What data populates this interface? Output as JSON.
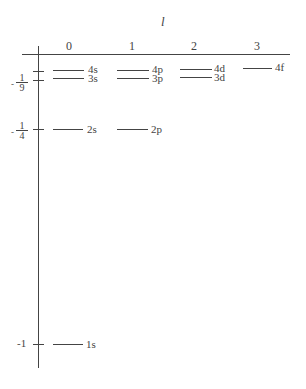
{
  "diagram": {
    "axis_title": "l",
    "columns": [
      {
        "label": "0",
        "x": 69
      },
      {
        "label": "1",
        "x": 132
      },
      {
        "label": "2",
        "x": 194
      },
      {
        "label": "3",
        "x": 257
      }
    ],
    "y_ticks": [
      {
        "label_minus": "-",
        "num": "1",
        "den": "9",
        "y": 80
      },
      {
        "label_minus": "-",
        "num": "1",
        "den": "4",
        "y": 129
      },
      {
        "label": "-1",
        "y": 344
      }
    ],
    "extra_tick_y": 71,
    "levels": [
      {
        "label": "4s",
        "x1": 53,
        "x2": 84,
        "y": 70
      },
      {
        "label": "3s",
        "x1": 53,
        "x2": 84,
        "y": 78
      },
      {
        "label": "4p",
        "x1": 117,
        "x2": 149,
        "y": 70
      },
      {
        "label": "3p",
        "x1": 117,
        "x2": 149,
        "y": 78
      },
      {
        "label": "4d",
        "x1": 180,
        "x2": 212,
        "y": 70
      },
      {
        "label": "3d",
        "x1": 180,
        "x2": 212,
        "y": 78
      },
      {
        "label": "4f",
        "x1": 243,
        "x2": 272,
        "y": 68
      },
      {
        "label": "2s",
        "x1": 53,
        "x2": 83,
        "y": 129
      },
      {
        "label": "2p",
        "x1": 117,
        "x2": 148,
        "y": 129
      },
      {
        "label": "1s",
        "x1": 53,
        "x2": 83,
        "y": 344
      }
    ]
  }
}
